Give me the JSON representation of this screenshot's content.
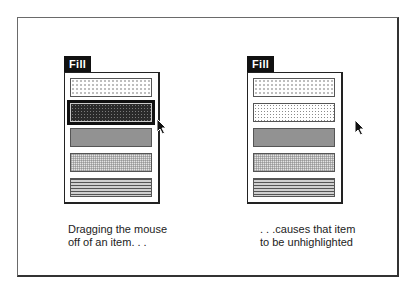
{
  "left_panel": {
    "menu_title": "Fill",
    "items": [
      {
        "pattern": "light-dots",
        "highlighted": false
      },
      {
        "pattern": "dark-dots",
        "highlighted": true
      },
      {
        "pattern": "medium-gray",
        "highlighted": false
      },
      {
        "pattern": "grid",
        "highlighted": false
      },
      {
        "pattern": "horizontal-lines",
        "highlighted": false
      }
    ],
    "caption_line1": "Dragging the mouse",
    "caption_line2": "off of an item. . ."
  },
  "right_panel": {
    "menu_title": "Fill",
    "items": [
      {
        "pattern": "light-dots",
        "highlighted": false
      },
      {
        "pattern": "dotted",
        "highlighted": false
      },
      {
        "pattern": "medium-gray",
        "highlighted": false
      },
      {
        "pattern": "grid",
        "highlighted": false
      },
      {
        "pattern": "horizontal-lines",
        "highlighted": false
      }
    ],
    "caption_line1": ". . .causes that item",
    "caption_line2": "to be unhighlighted"
  },
  "colors": {
    "menu_title_bg": "#111111",
    "highlight": "#111111",
    "frame": "#333333"
  }
}
